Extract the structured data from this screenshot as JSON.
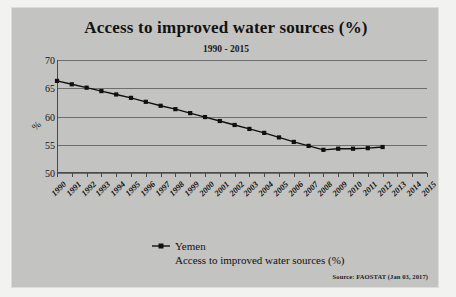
{
  "chart_data": {
    "type": "line",
    "title": "Access to improved water sources (%)",
    "subtitle": "1990 - 2015",
    "xlabel": "",
    "ylabel": "%",
    "ylim": [
      50,
      70
    ],
    "yticks": [
      50,
      55,
      60,
      65,
      70
    ],
    "grid": true,
    "legend_position": "bottom",
    "categories": [
      "1990",
      "1991",
      "1992",
      "1993",
      "1994",
      "1995",
      "1996",
      "1997",
      "1998",
      "1999",
      "2000",
      "2001",
      "2002",
      "2003",
      "2004",
      "2005",
      "2006",
      "2007",
      "2008",
      "2009",
      "2010",
      "2011",
      "2012",
      "2013",
      "2014",
      "2015"
    ],
    "series": [
      {
        "name": "Yemen",
        "label": "Access to improved water sources (%)",
        "color": "#101010",
        "marker": "square",
        "values": [
          66.3,
          65.7,
          65.1,
          64.5,
          63.9,
          63.3,
          62.6,
          61.9,
          61.3,
          60.6,
          59.9,
          59.2,
          58.5,
          57.8,
          57.1,
          56.3,
          55.5,
          54.8,
          54.1,
          54.3,
          54.3,
          54.4,
          54.6,
          null,
          null,
          null
        ]
      }
    ],
    "annotations": {
      "source": "Source: FAOSTAT (Jan 03, 2017)"
    }
  },
  "legend": {
    "name": "Yemen",
    "sublabel": "Access to improved water sources (%)"
  },
  "colors": {
    "panel_background": "#c3c3c1",
    "page_background": "#f2f2f0",
    "series": "#101010",
    "gridline": "#6d6d6d",
    "axis": "#4a4a4a",
    "text": "#121212"
  }
}
